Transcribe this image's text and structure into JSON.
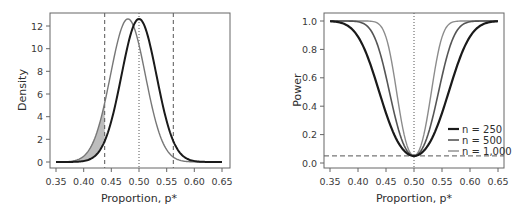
{
  "chart_data": [
    {
      "type": "line",
      "title": "",
      "xlabel": "Proportion, p*",
      "ylabel": "Density",
      "xlim": [
        0.35,
        0.65
      ],
      "ylim": [
        0,
        12.5
      ],
      "x_ticks": [
        "0.35",
        "0.40",
        "0.45",
        "0.50",
        "0.55",
        "0.60",
        "0.65"
      ],
      "y_ticks": [
        "0",
        "2",
        "4",
        "6",
        "8",
        "10",
        "12"
      ],
      "grid": false,
      "series": [
        {
          "name": "null distribution (p = 0.50)",
          "distribution": "normal",
          "mean": 0.5,
          "sd": 0.0316,
          "peak_density": 12.6,
          "color": "#1a1a1a"
        },
        {
          "name": "alternative distribution (p = 0.48)",
          "distribution": "normal",
          "mean": 0.48,
          "sd": 0.0316,
          "peak_density": 12.6,
          "color": "#777777"
        }
      ],
      "reference_lines": [
        {
          "orientation": "vertical",
          "x": 0.438,
          "style": "dashed",
          "label": "lower critical value"
        },
        {
          "orientation": "vertical",
          "x": 0.562,
          "style": "dashed",
          "label": "upper critical value"
        },
        {
          "orientation": "vertical",
          "x": 0.5,
          "style": "dotted",
          "label": "null proportion"
        }
      ],
      "shaded_region": {
        "x_from": 0.35,
        "x_to": 0.438,
        "between": "alternative and null curves",
        "color": "#bdbdbd"
      }
    },
    {
      "type": "line",
      "title": "",
      "xlabel": "Proportion, p*",
      "ylabel": "Power",
      "xlim": [
        0.35,
        0.65
      ],
      "ylim": [
        0,
        1.0
      ],
      "x_ticks": [
        "0.35",
        "0.40",
        "0.45",
        "0.50",
        "0.55",
        "0.60",
        "0.65"
      ],
      "y_ticks": [
        "0.0",
        "0.2",
        "0.4",
        "0.6",
        "0.8",
        "1.0"
      ],
      "grid": false,
      "legend_position": "lower right",
      "x": [
        0.35,
        0.375,
        0.4,
        0.425,
        0.45,
        0.475,
        0.5,
        0.525,
        0.55,
        0.575,
        0.6,
        0.625,
        0.65
      ],
      "series": [
        {
          "name": "n = 250",
          "color": "#1a1a1a",
          "width": 2.2,
          "values": [
            1.0,
            0.99,
            0.92,
            0.71,
            0.41,
            0.15,
            0.05,
            0.15,
            0.41,
            0.71,
            0.92,
            0.99,
            1.0
          ]
        },
        {
          "name": "n = 500",
          "color": "#555555",
          "width": 1.6,
          "values": [
            1.0,
            1.0,
            0.99,
            0.93,
            0.7,
            0.26,
            0.05,
            0.26,
            0.7,
            0.93,
            0.99,
            1.0,
            1.0
          ]
        },
        {
          "name": "n = 1,000",
          "color": "#8c8c8c",
          "width": 1.4,
          "values": [
            1.0,
            1.0,
            1.0,
            1.0,
            0.94,
            0.47,
            0.05,
            0.47,
            0.94,
            1.0,
            1.0,
            1.0,
            1.0
          ]
        }
      ],
      "reference_lines": [
        {
          "orientation": "horizontal",
          "y": 0.05,
          "style": "dashed",
          "label": "significance level"
        },
        {
          "orientation": "vertical",
          "x": 0.5,
          "style": "dotted",
          "label": "null proportion"
        }
      ]
    }
  ],
  "left": {
    "xlabel": "Proportion, p*",
    "ylabel": "Density",
    "x_ticks": [
      "0.35",
      "0.40",
      "0.45",
      "0.50",
      "0.55",
      "0.60",
      "0.65"
    ],
    "y_ticks": [
      "0",
      "2",
      "4",
      "6",
      "8",
      "10",
      "12"
    ]
  },
  "right": {
    "xlabel": "Proportion, p*",
    "ylabel": "Power",
    "x_ticks": [
      "0.35",
      "0.40",
      "0.45",
      "0.50",
      "0.55",
      "0.60",
      "0.65"
    ],
    "y_ticks": [
      "0.0",
      "0.2",
      "0.4",
      "0.6",
      "0.8",
      "1.0"
    ],
    "legend": [
      "n = 250",
      "n = 500",
      "n = 1,000"
    ]
  },
  "colors": {
    "axis": "#555555",
    "null_curve": "#1a1a1a",
    "alt_curve": "#777777",
    "shade": "#bdbdbd",
    "n250": "#1a1a1a",
    "n500": "#555555",
    "n1000": "#8c8c8c",
    "reference": "#555555"
  }
}
